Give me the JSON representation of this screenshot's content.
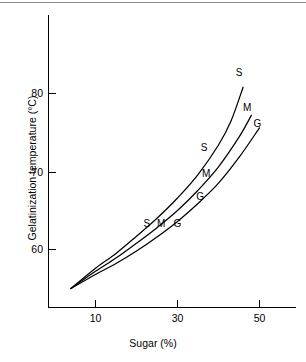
{
  "figure": {
    "background_color": "#ffffff",
    "line_color": "#000000",
    "top_rule_color": "#8d8d8d"
  },
  "chart_data": {
    "type": "line",
    "title": "",
    "xlabel": "Sugar (%)",
    "ylabel": "Gelatinization temperature (°C)",
    "xlim": [
      0,
      60
    ],
    "ylim": [
      54,
      86
    ],
    "xticks": [
      10,
      30,
      50
    ],
    "xtick_labels": [
      "10",
      "30",
      "50"
    ],
    "yticks": [
      60,
      70,
      80
    ],
    "ytick_labels": [
      "60",
      "70",
      "80"
    ],
    "grid": false,
    "legend": "inline-curve-labels",
    "series": [
      {
        "name": "S",
        "label": "S",
        "description": "Sucrose",
        "x": [
          4,
          10,
          15,
          20,
          25,
          30,
          35,
          40,
          43,
          46
        ],
        "y": [
          55.0,
          57.6,
          59.5,
          61.7,
          64.0,
          66.6,
          69.6,
          73.4,
          76.4,
          80.8
        ]
      },
      {
        "name": "M",
        "label": "M",
        "description": "Maltose",
        "x": [
          4,
          10,
          15,
          20,
          25,
          30,
          35,
          40,
          45,
          48
        ],
        "y": [
          55.0,
          57.2,
          58.9,
          60.8,
          62.8,
          65.0,
          67.6,
          70.6,
          74.4,
          77.2
        ]
      },
      {
        "name": "G",
        "label": "G",
        "description": "Glucose",
        "x": [
          4,
          10,
          15,
          20,
          25,
          30,
          35,
          40,
          45,
          50
        ],
        "y": [
          55.0,
          56.8,
          58.2,
          59.8,
          61.6,
          63.6,
          65.9,
          68.5,
          71.8,
          75.6
        ]
      }
    ],
    "curve_labels": [
      {
        "series": "S",
        "text": "S",
        "x": 22.5,
        "y": 62.9,
        "group": "lower"
      },
      {
        "series": "M",
        "text": "M",
        "x": 26.0,
        "y": 62.9,
        "group": "lower"
      },
      {
        "series": "G",
        "text": "G",
        "x": 30.0,
        "y": 62.9,
        "group": "lower"
      },
      {
        "series": "S",
        "text": "S",
        "x": 36.5,
        "y": 72.6,
        "group": "middle"
      },
      {
        "series": "M",
        "text": "M",
        "x": 37.0,
        "y": 69.3,
        "group": "middle"
      },
      {
        "series": "G",
        "text": "G",
        "x": 35.5,
        "y": 66.3,
        "group": "middle"
      },
      {
        "series": "S",
        "text": "S",
        "x": 45.0,
        "y": 82.3,
        "group": "upper"
      },
      {
        "series": "M",
        "text": "M",
        "x": 47.0,
        "y": 77.8,
        "group": "upper"
      },
      {
        "series": "G",
        "text": "G",
        "x": 49.5,
        "y": 75.7,
        "group": "upper"
      }
    ]
  }
}
